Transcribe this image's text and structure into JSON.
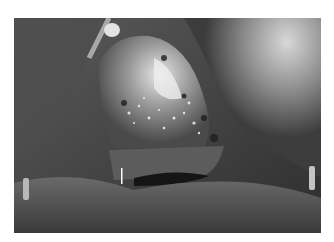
{
  "image": {
    "description": "Grayscale intraoperative surgical photograph showing exposed tissue with a central bright bony/tissue mass, surrounded by draped fabric; two metallic pins visible at lower left and lower right, a small white marker line near center-bottom.",
    "colors": {
      "background": "#ffffff",
      "dark_tissue": "#2a2a2a",
      "mid_tissue": "#6e6e6e",
      "highlight": "#e6e6e6",
      "drape": "#9a9a9a"
    }
  }
}
